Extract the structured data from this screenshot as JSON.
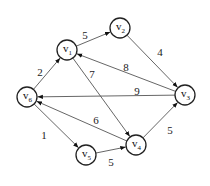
{
  "graph": {
    "type": "directed-weighted",
    "nodes": [
      {
        "id": "v1",
        "label": "v",
        "sub": "1",
        "x": 67,
        "y": 50
      },
      {
        "id": "v2",
        "label": "v",
        "sub": "2",
        "x": 120,
        "y": 28
      },
      {
        "id": "v3",
        "label": "v",
        "sub": "3",
        "x": 185,
        "y": 95
      },
      {
        "id": "v4",
        "label": "v",
        "sub": "4",
        "x": 136,
        "y": 145
      },
      {
        "id": "v5",
        "label": "v",
        "sub": "5",
        "x": 86,
        "y": 155
      },
      {
        "id": "v6",
        "label": "v",
        "sub": "6",
        "x": 27,
        "y": 97
      }
    ],
    "edges": [
      {
        "from": "v6",
        "to": "v1",
        "weight": "2",
        "lx": 40,
        "ly": 73
      },
      {
        "from": "v1",
        "to": "v2",
        "weight": "5",
        "lx": 85,
        "ly": 36
      },
      {
        "from": "v2",
        "to": "v3",
        "weight": "4",
        "lx": 160,
        "ly": 53
      },
      {
        "from": "v3",
        "to": "v1",
        "weight": "8",
        "lx": 126,
        "ly": 68
      },
      {
        "from": "v3",
        "to": "v6",
        "weight": "9",
        "lx": 137,
        "ly": 92
      },
      {
        "from": "v1",
        "to": "v4",
        "weight": "7",
        "lx": 92,
        "ly": 75
      },
      {
        "from": "v4",
        "to": "v6",
        "weight": "6",
        "lx": 96,
        "ly": 121
      },
      {
        "from": "v6",
        "to": "v5",
        "weight": "1",
        "lx": 44,
        "ly": 136
      },
      {
        "from": "v5",
        "to": "v4",
        "weight": "5",
        "lx": 111,
        "ly": 163
      },
      {
        "from": "v4",
        "to": "v3",
        "weight": "5",
        "lx": 170,
        "ly": 131
      }
    ]
  }
}
